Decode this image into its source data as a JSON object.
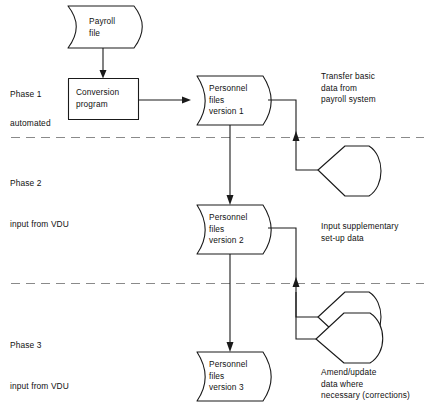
{
  "diagram": {
    "colors": {
      "stroke": "#1a1a1a",
      "divider": "#8a8a8a",
      "background": "#ffffff",
      "text": "#111111"
    },
    "phases": [
      {
        "id": "phase-1",
        "name": "Phase 1",
        "mode": "automated"
      },
      {
        "id": "phase-2",
        "name": "Phase 2",
        "mode": "input from VDU"
      },
      {
        "id": "phase-3",
        "name": "Phase 3",
        "mode": "input from VDU"
      }
    ],
    "nodes": {
      "payroll_file": {
        "label": "Payroll\nfile",
        "shape": "stored-data"
      },
      "conversion_program": {
        "label": "Conversion\nprogram",
        "shape": "process"
      },
      "personnel_v1": {
        "label": "Personnel\nfiles\nversion 1",
        "shape": "stored-data"
      },
      "personnel_v2": {
        "label": "Personnel\nfiles\nversion 2",
        "shape": "stored-data"
      },
      "personnel_v3": {
        "label": "Personnel\nfiles\nversion 3",
        "shape": "stored-data"
      },
      "display_1": {
        "label": "",
        "shape": "display"
      },
      "display_2": {
        "label": "",
        "shape": "display"
      },
      "display_3": {
        "label": "",
        "shape": "display"
      }
    },
    "notes": {
      "transfer": "Transfer basic\ndata from\npayroll system",
      "supplementary": "Input supplementary\nset-up data",
      "amend": "Amend/update\ndata where\nnecessary (corrections)"
    }
  }
}
